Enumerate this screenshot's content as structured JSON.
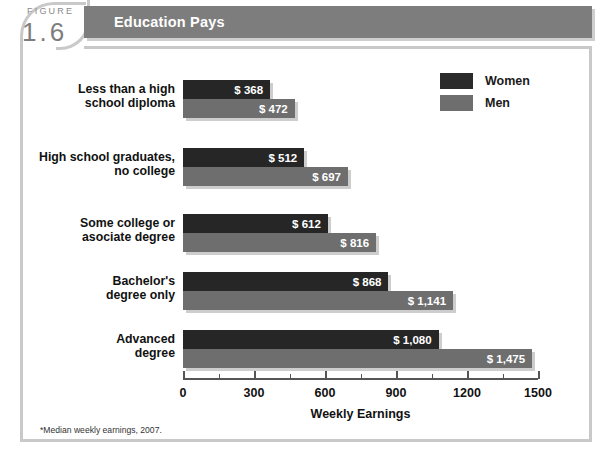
{
  "figure": {
    "word": "FIGURE",
    "number": "1.6"
  },
  "title": "Education Pays",
  "legend": {
    "items": [
      {
        "label": "Women",
        "color": "#262626",
        "icon": "legend-swatch-women"
      },
      {
        "label": "Men",
        "color": "#6e6e6e",
        "icon": "legend-swatch-men"
      }
    ]
  },
  "footnote": "*Median weekly earnings, 2007.",
  "colors": {
    "banner": "#7d7d7d",
    "women_bar": "#262626",
    "men_bar": "#6e6e6e",
    "frame": "#c9c9c9",
    "shadow": "#c4c4c4"
  },
  "chart_data": {
    "type": "bar",
    "orientation": "horizontal",
    "title": "Education Pays",
    "xlabel": "Weekly Earnings",
    "ylabel": "",
    "xlim": [
      0,
      1500
    ],
    "xticks": [
      0,
      300,
      600,
      900,
      1200,
      1500
    ],
    "xtick_labels": [
      "0",
      "300",
      "600",
      "900",
      "1200",
      "1500"
    ],
    "grid": false,
    "legend_position": "top-right",
    "categories": [
      "Less than a high school diploma",
      "High school graduates, no college",
      "Some college or asociate degree",
      "Bachelor's degree only",
      "Advanced degree"
    ],
    "category_lines": [
      [
        "Less than a high",
        "school diploma"
      ],
      [
        "High school graduates,",
        "no college"
      ],
      [
        "Some college or",
        "asociate degree"
      ],
      [
        "Bachelor's",
        "degree only"
      ],
      [
        "Advanced",
        "degree"
      ]
    ],
    "series": [
      {
        "name": "Women",
        "color": "#262626",
        "values": [
          368,
          512,
          612,
          868,
          1080
        ],
        "data_labels": [
          "$ 368",
          "$ 512",
          "$ 612",
          "$ 868",
          "$ 1,080"
        ]
      },
      {
        "name": "Men",
        "color": "#6e6e6e",
        "values": [
          472,
          697,
          816,
          1141,
          1475
        ],
        "data_labels": [
          "$ 472",
          "$ 697",
          "$ 816",
          "$ 1,141",
          "$ 1,475"
        ]
      }
    ],
    "note": "*Median weekly earnings, 2007."
  }
}
